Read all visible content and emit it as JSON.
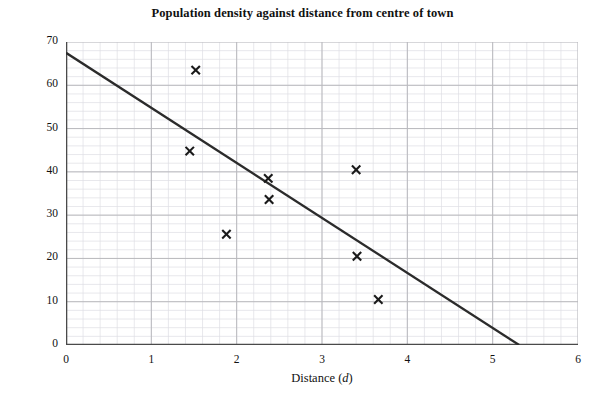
{
  "chart_data": {
    "type": "scatter",
    "title": "Population density against distance from centre of town",
    "xlabel": "Distance (d)",
    "ylabel": "Population density (P)",
    "xlabel_text": "Distance",
    "xlabel_var": "d",
    "ylabel_text": "Population density",
    "ylabel_var": "P",
    "xlim": [
      0,
      6
    ],
    "ylim": [
      0,
      70
    ],
    "xticks": [
      0,
      1,
      2,
      3,
      4,
      5,
      6
    ],
    "yticks": [
      0,
      10,
      20,
      30,
      40,
      50,
      60,
      70
    ],
    "xtick_labels": [
      "0",
      "1",
      "2",
      "3",
      "4",
      "5",
      "6"
    ],
    "ytick_labels": [
      "0",
      "10",
      "20",
      "30",
      "40",
      "50",
      "60",
      "70"
    ],
    "grid": true,
    "grid_major_color": "#b9b9bd",
    "grid_minor_color": "#dedee4",
    "grid_minor_x_step": 0.2,
    "grid_minor_y_step": 2,
    "legend": "none",
    "marker": "x",
    "marker_color": "#1a1a1a",
    "points": [
      {
        "d": 1.52,
        "P": 63.5
      },
      {
        "d": 1.45,
        "P": 44.8
      },
      {
        "d": 1.88,
        "P": 25.6
      },
      {
        "d": 2.37,
        "P": 38.5
      },
      {
        "d": 2.38,
        "P": 33.6
      },
      {
        "d": 3.4,
        "P": 40.5
      },
      {
        "d": 3.41,
        "P": 20.5
      },
      {
        "d": 3.66,
        "P": 10.5
      }
    ],
    "series": [
      {
        "name": "Line of best fit",
        "type": "line",
        "color": "#2b2b2b",
        "x": [
          0,
          5.31
        ],
        "y": [
          67.5,
          0
        ]
      }
    ],
    "annotations": []
  }
}
